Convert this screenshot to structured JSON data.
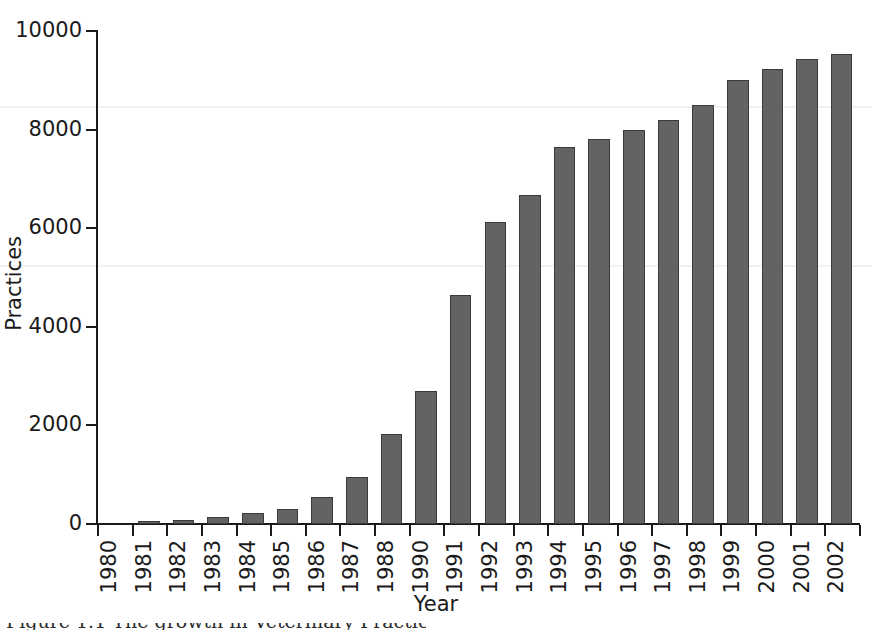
{
  "chart_data": {
    "type": "bar",
    "title": "",
    "xlabel": "Year",
    "ylabel": "Practices",
    "categories": [
      "1980",
      "1981",
      "1982",
      "1983",
      "1984",
      "1985",
      "1986",
      "1987",
      "1988",
      "1990",
      "1991",
      "1992",
      "1993",
      "1994",
      "1995",
      "1996",
      "1997",
      "1998",
      "1999",
      "2000",
      "2001",
      "2002"
    ],
    "values": [
      0,
      60,
      80,
      140,
      230,
      310,
      550,
      950,
      1830,
      2700,
      4650,
      6120,
      6670,
      7650,
      7800,
      8000,
      8200,
      8500,
      9000,
      9230,
      9440,
      9540
    ],
    "ylim": [
      0,
      10000
    ],
    "yticks": [
      0,
      2000,
      4000,
      6000,
      8000,
      10000
    ],
    "ytick_labels": [
      "0",
      "2000",
      "4000",
      "6000",
      "8000",
      "10000"
    ],
    "grid": false,
    "legend": null,
    "bar_color": "#636363",
    "bar_edge_color": "#3a3a3a",
    "axis_color": "#1a1a1a",
    "background": "#ffffff"
  },
  "caption": {
    "text": "Figure 1.1 The growth in Veterinary Practices"
  }
}
